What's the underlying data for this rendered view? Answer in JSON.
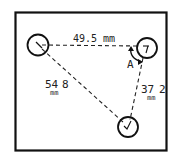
{
  "diagram": {
    "title": "",
    "frame": {
      "x": 15,
      "y": 12,
      "width": 152,
      "height": 139
    },
    "holes": [
      {
        "id": "hole-top-left",
        "cx": 38,
        "cy": 45,
        "r": 11
      },
      {
        "id": "hole-top-right",
        "cx": 147,
        "cy": 48,
        "r": 10
      },
      {
        "id": "hole-bottom",
        "cx": 128,
        "cy": 127,
        "r": 10
      }
    ],
    "dimensions": {
      "top": {
        "value": "49.5",
        "unit": "mm",
        "label": "49.5 mm"
      },
      "left": {
        "value": "54.8",
        "unit": "mm",
        "value_main": "54",
        "value_dec": "8",
        "unit_label": "mm"
      },
      "right": {
        "value": "37.2",
        "unit": "mm",
        "value_main": "37",
        "value_dec": "2",
        "unit_label": "mm"
      }
    },
    "angle": {
      "label": "A"
    },
    "colors": {
      "line": "#111111",
      "background": "#ffffff"
    }
  }
}
